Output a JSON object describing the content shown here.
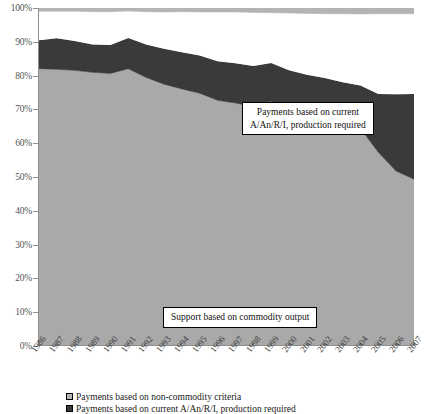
{
  "chart_data": {
    "type": "area",
    "stacked": true,
    "normalized": true,
    "title": "",
    "subtitle": "",
    "xlabel": "",
    "ylabel": "",
    "grid": false,
    "legend_position": "bottom",
    "ylim": [
      0,
      100
    ],
    "y_ticks": [
      "0%",
      "10%",
      "20%",
      "30%",
      "40%",
      "50%",
      "60%",
      "70%",
      "80%",
      "90%",
      "100%"
    ],
    "y_tick_values": [
      0,
      10,
      20,
      30,
      40,
      50,
      60,
      70,
      80,
      90,
      100
    ],
    "categories": [
      "1986",
      "1987",
      "1988",
      "1989",
      "1990",
      "1991",
      "1992",
      "1993",
      "1994",
      "1995",
      "1996",
      "1997",
      "1998",
      "1999",
      "2000",
      "2001",
      "2002",
      "2003",
      "2004",
      "2005",
      "2006",
      "2007"
    ],
    "series": [
      {
        "name": "Support based on commodity output",
        "color": "#a9a9a9",
        "values": [
          82.0,
          81.8,
          81.5,
          80.9,
          80.6,
          82.0,
          79.4,
          77.4,
          76.0,
          74.7,
          72.6,
          71.8,
          70.8,
          72.3,
          69.9,
          68.4,
          67.3,
          65.9,
          64.3,
          57.2,
          51.6,
          49.2
        ]
      },
      {
        "name": "Payments based on current A/An/R/I, production required",
        "color": "#3a3a3a",
        "values": [
          8.4,
          9.2,
          8.7,
          8.3,
          8.4,
          9.1,
          9.8,
          10.5,
          10.9,
          11.2,
          11.6,
          11.8,
          12.0,
          11.4,
          11.6,
          11.8,
          11.9,
          12.1,
          12.7,
          17.3,
          22.8,
          25.3
        ]
      },
      {
        "name": "white-band",
        "color": "#ffffff",
        "values": [
          8.6,
          8.0,
          8.8,
          9.7,
          9.9,
          8.0,
          9.7,
          10.9,
          12.0,
          12.9,
          14.6,
          15.2,
          15.9,
          14.9,
          17.0,
          18.2,
          19.1,
          20.3,
          21.2,
          23.8,
          23.9,
          23.8
        ]
      },
      {
        "name": "Payments based on non-commodity criteria",
        "color": "#b4b4b4",
        "values": [
          1.0,
          1.0,
          1.0,
          1.1,
          1.1,
          0.9,
          1.1,
          1.2,
          1.1,
          1.2,
          1.2,
          1.2,
          1.3,
          1.4,
          1.5,
          1.6,
          1.7,
          1.7,
          1.8,
          1.7,
          1.7,
          1.7
        ]
      }
    ],
    "annotations": [
      {
        "id": "upper",
        "line1": "Payments based on current",
        "line2": "A/An/R/I, production required"
      },
      {
        "id": "lower",
        "line1": "Support based on commodity output",
        "line2": ""
      }
    ],
    "legend_entries": [
      {
        "label": "Payments based on non-commodity criteria",
        "color": "#b4b4b4"
      },
      {
        "label": "Payments based on current A/An/R/I, production required",
        "color": "#3a3a3a"
      }
    ]
  },
  "colors": {
    "commodity_output": "#a9a9a9",
    "current_payments": "#3a3a3a",
    "non_commodity": "#b4b4b4",
    "white_band": "#ffffff",
    "axis": "#8f8f8f",
    "y_label": "#555555",
    "x_label": "#3c3c3c"
  }
}
